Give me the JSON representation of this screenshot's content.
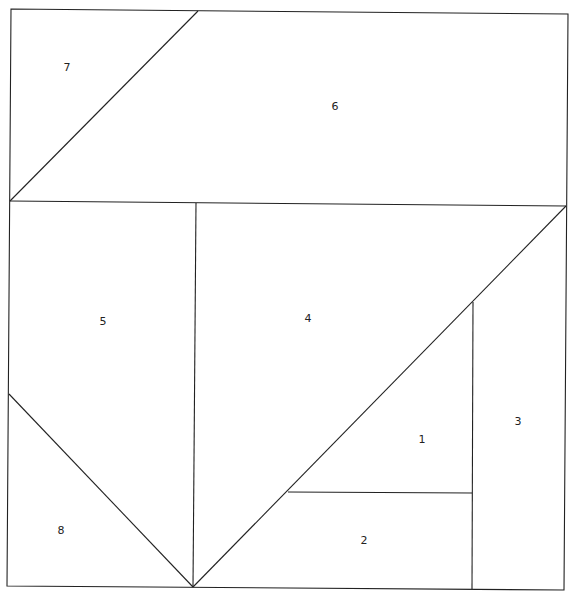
{
  "diagram": {
    "type": "quilt-block-pattern",
    "stroke_color": "#222222",
    "background": "#ffffff",
    "pieces": [
      {
        "id": "1",
        "label": "1",
        "x": 422,
        "y": 440
      },
      {
        "id": "2",
        "label": "2",
        "x": 364,
        "y": 541
      },
      {
        "id": "3",
        "label": "3",
        "x": 518,
        "y": 422
      },
      {
        "id": "4",
        "label": "4",
        "x": 308,
        "y": 319
      },
      {
        "id": "5",
        "label": "5",
        "x": 103,
        "y": 322
      },
      {
        "id": "6",
        "label": "6",
        "x": 335,
        "y": 107
      },
      {
        "id": "7",
        "label": "7",
        "x": 67,
        "y": 68
      },
      {
        "id": "8",
        "label": "8",
        "x": 61,
        "y": 531
      }
    ]
  }
}
